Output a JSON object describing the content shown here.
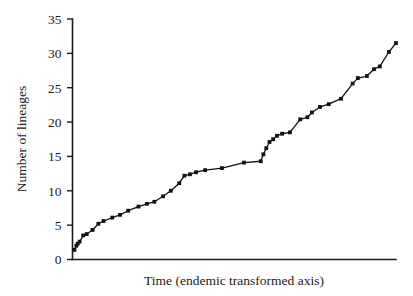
{
  "chart_data": {
    "type": "line",
    "title": "",
    "subtitle": "",
    "xlabel": "Time (endemic transformed axis)",
    "ylabel": "Number of lineages",
    "xlim": [
      0,
      100
    ],
    "ylim": [
      0,
      35
    ],
    "grid": false,
    "legend": "none",
    "y_ticks": [
      0,
      5,
      10,
      15,
      20,
      25,
      30,
      35
    ],
    "y_tick_labels": [
      "0",
      "5",
      "10",
      "15",
      "20",
      "25",
      "30",
      "35"
    ],
    "x_ticks": [],
    "x_tick_labels": [],
    "markers": "filled-square",
    "series": [
      {
        "name": "lineages through time",
        "x": [
          0.6,
          1.2,
          1.6,
          2.2,
          3.3,
          4.4,
          6.2,
          8.0,
          9.6,
          12.3,
          14.7,
          17.2,
          20.4,
          23.0,
          25.3,
          28.0,
          30.4,
          33.0,
          34.6,
          36.3,
          38.2,
          41.0,
          46.2,
          53.0,
          58.2,
          59.0,
          59.9,
          60.9,
          62.0,
          63.2,
          64.8,
          67.2,
          70.4,
          72.6,
          74.0,
          76.5,
          79.2,
          83.0,
          86.6,
          88.2,
          91.0,
          93.2,
          95.0,
          97.8,
          100.0
        ],
        "y": [
          1.4,
          2.0,
          2.3,
          2.6,
          3.5,
          3.7,
          4.3,
          5.2,
          5.6,
          6.1,
          6.5,
          7.1,
          7.7,
          8.1,
          8.4,
          9.2,
          10.0,
          11.1,
          12.2,
          12.4,
          12.7,
          13.0,
          13.3,
          14.1,
          14.3,
          15.3,
          16.2,
          17.1,
          17.5,
          18.0,
          18.3,
          18.5,
          20.4,
          20.7,
          21.4,
          22.2,
          22.6,
          23.4,
          25.6,
          26.4,
          26.7,
          27.7,
          28.1,
          30.2,
          31.5
        ]
      }
    ]
  },
  "figure": {
    "background_color": "#ffffff",
    "line_color": "#111111",
    "axis_color": "#1a1a1a"
  }
}
